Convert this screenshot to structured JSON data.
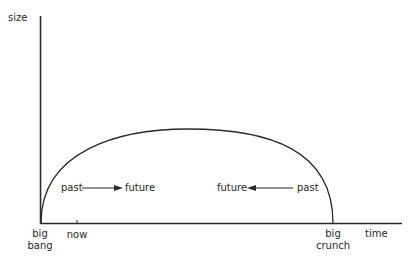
{
  "diagram": {
    "type": "closed-universe-size-vs-time",
    "axes": {
      "y_label": "size",
      "x_label": "time"
    },
    "x_markers": {
      "start_line1": "big",
      "start_line2": "bang",
      "now": "now",
      "end_line1": "big",
      "end_line2": "crunch"
    },
    "arrows": {
      "left": {
        "from": "past",
        "to": "future",
        "direction": "right"
      },
      "right": {
        "from": "past",
        "to": "future",
        "direction": "left"
      }
    },
    "colors": {
      "line": "#2a2a2a",
      "background": "#ffffff"
    }
  }
}
